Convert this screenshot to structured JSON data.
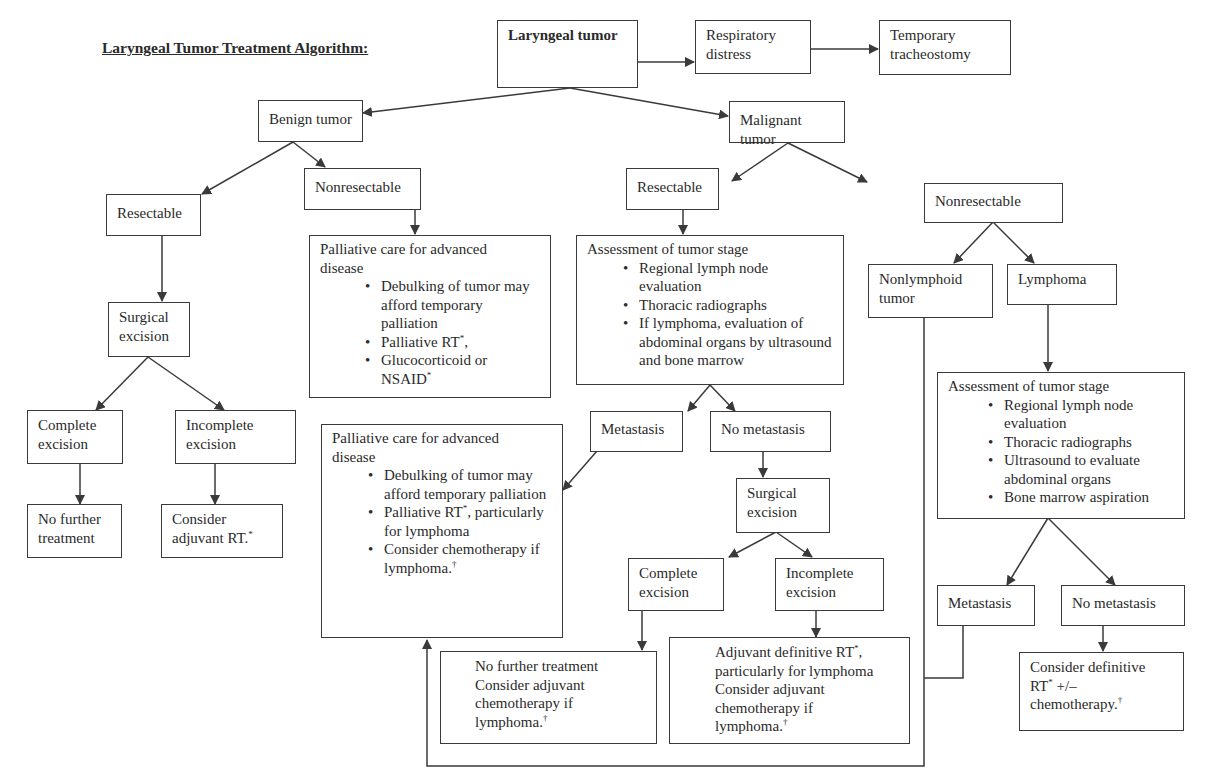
{
  "title": "Laryngeal Tumor Treatment Algorithm:",
  "nodes": {
    "laryngeal_tumor": "Laryngeal tumor",
    "respiratory_distress": "Respiratory distress",
    "temporary_tracheostomy": "Temporary tracheostomy",
    "benign_tumor": "Benign tumor",
    "malignant_tumor": "Malignant tumor",
    "benign_resectable": "Resectable",
    "benign_nonresectable": "Nonresectable",
    "benign_surgical_excision": "Surgical excision",
    "benign_complete_excision": "Complete excision",
    "benign_incomplete_excision": "Incomplete excision",
    "benign_no_further_treatment": "No further treatment",
    "benign_consider_adjuvant": {
      "text": "Consider adjuvant RT.",
      "mark": "*"
    },
    "benign_palliative": {
      "heading": "Palliative care for advanced disease",
      "bullets": [
        {
          "text": "Debulking of tumor may afford temporary palliation",
          "mark": ""
        },
        {
          "text": "Palliative RT",
          "mark": "*",
          "suffix": ","
        },
        {
          "text": "Glucocorticoid or NSAID",
          "mark": "*",
          "suffix": ""
        }
      ]
    },
    "malignant_resectable": "Resectable",
    "malignant_nonresectable": "Nonresectable",
    "resectable_assessment": {
      "heading": "Assessment of tumor stage",
      "bullets": [
        "Regional lymph node evaluation",
        "Thoracic radiographs",
        "If lymphoma, evaluation of abdominal organs by ultrasound and bone marrow"
      ]
    },
    "resectable_metastasis": "Metastasis",
    "resectable_no_metastasis": "No metastasis",
    "malignant_palliative": {
      "heading": "Palliative care for advanced disease",
      "bullets": [
        {
          "text": "Debulking of tumor may afford temporary palliation",
          "mark": "",
          "tail": ""
        },
        {
          "text": "Palliative RT",
          "mark": "*",
          "tail": ", particularly for lymphoma"
        },
        {
          "text": "Consider chemotherapy if lymphoma.",
          "mark": "†",
          "tail": ""
        }
      ]
    },
    "malignant_surgical_excision": "Surgical excision",
    "malignant_complete_excision": "Complete excision",
    "malignant_incomplete_excision": "Incomplete excision",
    "complete_outcome": {
      "line1": "No further treatment",
      "line2": "Consider adjuvant chemotherapy if lymphoma.",
      "mark": "†"
    },
    "incomplete_outcome": {
      "line1": "Adjuvant definitive RT",
      "mark1": "*",
      "line1_tail": ", particularly for lymphoma",
      "line2": "Consider adjuvant chemotherapy if lymphoma.",
      "mark2": "†"
    },
    "nonlymphoid_tumor": "Nonlymphoid tumor",
    "lymphoma": "Lymphoma",
    "lymphoma_assessment": {
      "heading": "Assessment of tumor stage",
      "bullets": [
        "Regional lymph node evaluation",
        "Thoracic radiographs",
        "Ultrasound to evaluate abdominal organs",
        "Bone marrow aspiration"
      ]
    },
    "lymphoma_metastasis": "Metastasis",
    "lymphoma_no_metastasis": "No metastasis",
    "lymphoma_definitive": {
      "text1": "Consider definitive RT",
      "mark1": "*",
      "text2": " +/– chemotherapy.",
      "mark2": "†"
    }
  },
  "colors": {
    "line": "#3a3a3a",
    "text": "#2a2a2a",
    "background": "#ffffff"
  }
}
